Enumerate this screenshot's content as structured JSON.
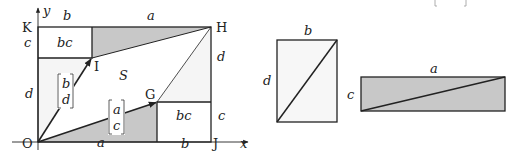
{
  "main_figure": {
    "points": {
      "origin": "O",
      "top_left": "K",
      "top_right": "H",
      "bottom_right": "J",
      "vector1_tip": "I",
      "vector2_tip": "G"
    },
    "axes": {
      "x_label": "x",
      "y_label": "y"
    },
    "top_segment_labels": {
      "left": "b",
      "right": "a"
    },
    "bottom_segment_labels": {
      "left": "a",
      "right": "b"
    },
    "left_side_labels": {
      "upper": "c",
      "lower": "d"
    },
    "right_side_labels": {
      "upper": "d",
      "lower": "c"
    },
    "box_labels": {
      "top_left_box": "bc",
      "bottom_right_box": "bc"
    },
    "region_label": "S",
    "vector_bd": {
      "top": "b",
      "bottom": "d"
    },
    "vector_ac": {
      "top": "a",
      "bottom": "c"
    }
  },
  "rect_bd": {
    "top_label": "b",
    "side_label": "d"
  },
  "rect_ac": {
    "top_label": "a",
    "side_label": "c"
  },
  "colors": {
    "shade": "#c8c8c8",
    "light_fill": "#f5f5f5",
    "stroke": "#222222"
  }
}
